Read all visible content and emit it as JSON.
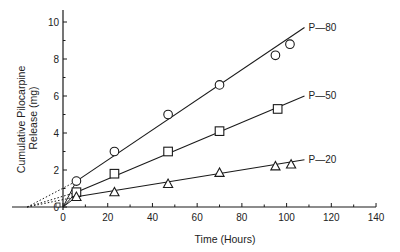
{
  "chart_data": {
    "type": "line",
    "title": "",
    "xlabel": "Time (Hours)",
    "ylabel_lines": [
      "Cumulative Pilocarpine",
      "Release (mg)"
    ],
    "ylabel": "Cumulative Pilocarpine Release (mg)",
    "xlim": [
      -20,
      140
    ],
    "ylim": [
      0,
      10.5
    ],
    "xticks": [
      0,
      20,
      40,
      60,
      80,
      100,
      120,
      140
    ],
    "yticks": [
      0,
      2,
      4,
      6,
      8,
      10
    ],
    "grid": false,
    "legend": "inline labels at line ends",
    "series": [
      {
        "name": "P—80",
        "marker": "circle",
        "x": [
          6,
          23,
          47,
          70,
          95,
          101.5
        ],
        "y": [
          1.4,
          3.0,
          5.0,
          6.6,
          8.2,
          8.8
        ],
        "fit_end": [
          108,
          9.7
        ],
        "extrapolation_intercept_x": -16
      },
      {
        "name": "P—50",
        "marker": "square",
        "x": [
          6,
          23,
          47,
          70,
          96
        ],
        "y": [
          0.8,
          1.8,
          3.0,
          4.1,
          5.3
        ],
        "fit_end": [
          108,
          6.0
        ],
        "extrapolation_intercept_x": -16
      },
      {
        "name": "P—20",
        "marker": "triangle",
        "x": [
          6,
          23,
          47,
          70,
          95,
          102
        ],
        "y": [
          0.55,
          0.8,
          1.25,
          1.85,
          2.2,
          2.3
        ],
        "fit_end": [
          108,
          2.55
        ],
        "extrapolation_intercept_x": -16
      }
    ]
  }
}
